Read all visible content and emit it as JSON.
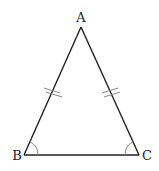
{
  "diagram": {
    "type": "isosceles-triangle",
    "vertices": {
      "A": {
        "label": "A",
        "x": 81,
        "y": 27
      },
      "B": {
        "label": "B",
        "x": 24,
        "y": 155
      },
      "C": {
        "label": "C",
        "x": 139,
        "y": 155
      }
    },
    "equal_sides": [
      "AB",
      "AC"
    ],
    "equal_side_tick_count": 2,
    "equal_angles": [
      "B",
      "C"
    ],
    "colors": {
      "stroke": "#222222",
      "tick": "#888888",
      "arc": "#888888",
      "background": "#ffffff"
    }
  }
}
